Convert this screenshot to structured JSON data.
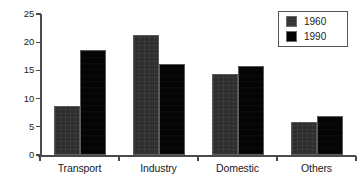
{
  "chart_data": {
    "type": "bar",
    "title": "",
    "subtitle": "",
    "xlabel": "",
    "ylabel": "",
    "categories": [
      "Transport",
      "Industry",
      "Domestic",
      "Others"
    ],
    "series": [
      {
        "name": "1960",
        "color": "#2d2d2d",
        "values": [
          8.7,
          21.2,
          14.4,
          5.9
        ]
      },
      {
        "name": "1990",
        "color": "#050505",
        "values": [
          18.6,
          16.2,
          15.8,
          7.0
        ]
      }
    ],
    "ylim": [
      0,
      25
    ],
    "yticks": [
      0,
      5,
      10,
      15,
      20,
      25
    ],
    "ytick_labels": [
      "0",
      "5",
      "10",
      "15",
      "20",
      "25"
    ],
    "grid": false,
    "legend_position": "top-right",
    "legend_entries": [
      "1960",
      "1990"
    ],
    "annotations": []
  }
}
